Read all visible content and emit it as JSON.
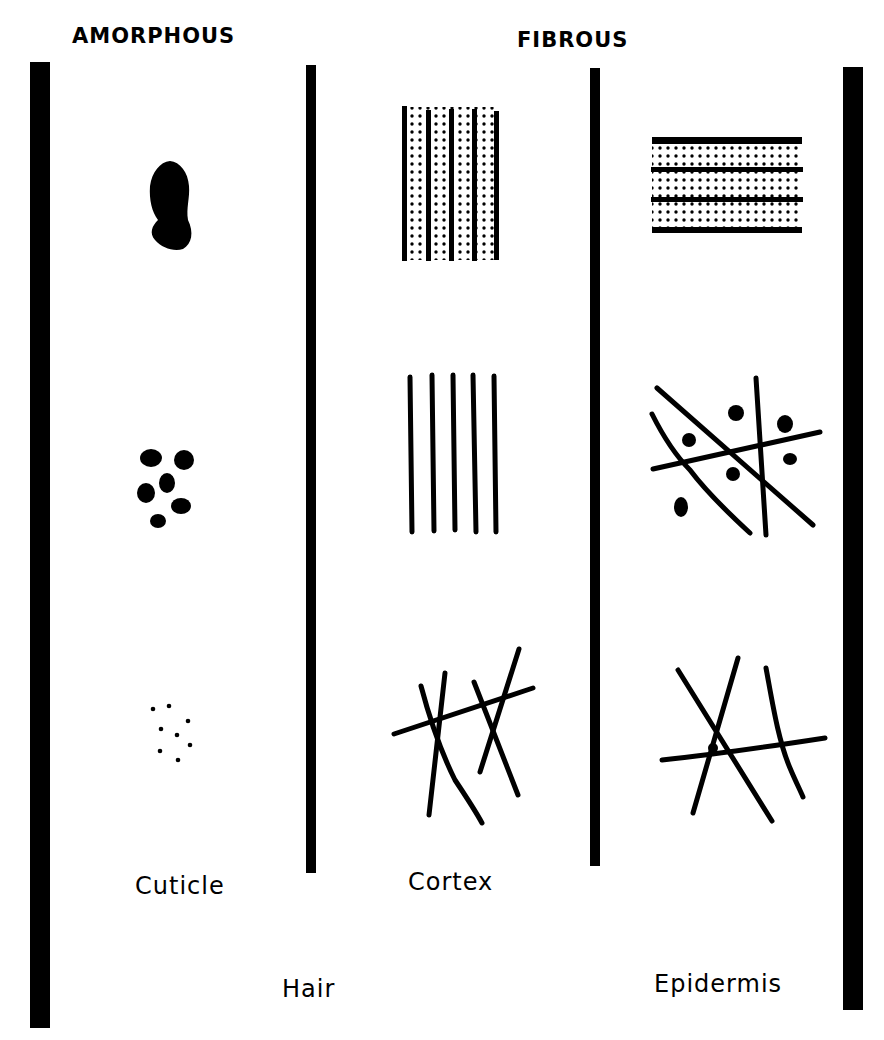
{
  "headings": {
    "amorphous": "AMORPHOUS",
    "fibrous": "FIBROUS"
  },
  "column_labels": {
    "cuticle": "Cuticle",
    "cortex": "Cortex"
  },
  "group_labels": {
    "hair": "Hair",
    "epidermis": "Epidermis"
  },
  "colors": {
    "ink": "#000000",
    "paper": "#ffffff"
  },
  "panels": {
    "cuticle": [
      "large-irregular-blob",
      "cluster-of-six-granules",
      "scattered-fine-dots"
    ],
    "cortex": [
      "striped-dotted-vertical-block",
      "parallel-vertical-filaments",
      "crossed-filaments"
    ],
    "epidermis": [
      "striped-dotted-horizontal-block",
      "crossed-filaments-with-granules",
      "crossed-filaments"
    ]
  }
}
